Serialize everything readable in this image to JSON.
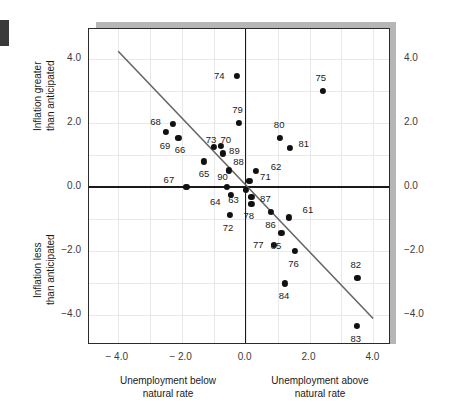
{
  "chart_data": {
    "type": "scatter",
    "title": "",
    "xlabel": "Unemployment relative to natural rate",
    "ylabel": "Inflation relative to anticipated",
    "xlim": [
      -4.9,
      4.55
    ],
    "ylim": [
      -4.95,
      4.95
    ],
    "grid": true,
    "legend": "none",
    "xticks": [
      -4.0,
      -2.0,
      0.0,
      2.0,
      4.0
    ],
    "xticklabels": [
      "− 4.0",
      "− 2.0",
      "0.0",
      "2.0",
      "4.0"
    ],
    "yticks": [
      4.0,
      2.0,
      0.0,
      -2.0,
      -4.0
    ],
    "yticklabels": [
      "4.0",
      "2.0",
      "0.0",
      "−2.0",
      "−4.0"
    ],
    "yticklabels_right": [
      "4.0",
      "2.0",
      "0.0",
      "−2.0",
      "−4.0"
    ],
    "point_labels_are": "two-digit year",
    "points": [
      {
        "label": "61",
        "x": 1.35,
        "y": -0.95,
        "lx": 1.95,
        "ly": -0.72
      },
      {
        "label": "62",
        "x": 0.32,
        "y": 0.5,
        "lx": 0.95,
        "ly": 0.63
      },
      {
        "label": "63",
        "x": 0.0,
        "y": -0.1,
        "lx": -0.38,
        "ly": -0.4
      },
      {
        "label": "64",
        "x": -0.45,
        "y": -0.25,
        "lx": -0.95,
        "ly": -0.48
      },
      {
        "label": "65",
        "x": -1.3,
        "y": 0.8,
        "lx": -1.3,
        "ly": 0.4
      },
      {
        "label": "66",
        "x": -2.1,
        "y": 1.55,
        "lx": -2.05,
        "ly": 1.15
      },
      {
        "label": "67",
        "x": -1.85,
        "y": 0.0,
        "lx": -2.4,
        "ly": 0.22
      },
      {
        "label": "68",
        "x": -2.28,
        "y": 1.98,
        "lx": -2.82,
        "ly": 2.05
      },
      {
        "label": "69",
        "x": -2.5,
        "y": 1.72,
        "lx": -2.52,
        "ly": 1.3
      },
      {
        "label": "70",
        "x": -0.78,
        "y": 1.3,
        "lx": -0.62,
        "ly": 1.48
      },
      {
        "label": "71",
        "x": 0.12,
        "y": 0.18,
        "lx": 0.62,
        "ly": 0.3
      },
      {
        "label": "72",
        "x": -0.5,
        "y": -0.88,
        "lx": -0.55,
        "ly": -1.28
      },
      {
        "label": "73",
        "x": -1.0,
        "y": 1.25,
        "lx": -1.08,
        "ly": 1.48
      },
      {
        "label": "74",
        "x": -0.28,
        "y": 3.48,
        "lx": -0.82,
        "ly": 3.48
      },
      {
        "label": "75",
        "x": 2.42,
        "y": 3.0,
        "lx": 2.35,
        "ly": 3.4
      },
      {
        "label": "76",
        "x": 1.55,
        "y": -2.0,
        "lx": 1.5,
        "ly": -2.4
      },
      {
        "label": "77",
        "x": 0.88,
        "y": -1.82,
        "lx": 0.4,
        "ly": -1.82
      },
      {
        "label": "78",
        "x": 0.18,
        "y": -0.52,
        "lx": 0.1,
        "ly": -0.92
      },
      {
        "label": "79",
        "x": -0.2,
        "y": 2.0,
        "lx": -0.25,
        "ly": 2.4
      },
      {
        "label": "80",
        "x": 1.08,
        "y": 1.55,
        "lx": 1.05,
        "ly": 1.95
      },
      {
        "label": "81",
        "x": 1.38,
        "y": 1.22,
        "lx": 1.82,
        "ly": 1.35
      },
      {
        "label": "82",
        "x": 3.5,
        "y": -2.85,
        "lx": 3.45,
        "ly": -2.45
      },
      {
        "label": "83",
        "x": 3.48,
        "y": -4.35,
        "lx": 3.45,
        "ly": -4.75
      },
      {
        "label": "84",
        "x": 1.22,
        "y": -3.02,
        "lx": 1.2,
        "ly": -3.42
      },
      {
        "label": "85",
        "x": 1.12,
        "y": -1.45,
        "lx": 0.95,
        "ly": -1.85
      },
      {
        "label": "86",
        "x": 0.8,
        "y": -0.78,
        "lx": 0.78,
        "ly": -1.18
      },
      {
        "label": "87",
        "x": 0.18,
        "y": -0.32,
        "lx": 0.62,
        "ly": -0.38
      },
      {
        "label": "88",
        "x": -0.52,
        "y": 0.52,
        "lx": -0.22,
        "ly": 0.78
      },
      {
        "label": "89",
        "x": -0.72,
        "y": 1.05,
        "lx": -0.35,
        "ly": 1.12
      },
      {
        "label": "90",
        "x": -0.58,
        "y": 0.0,
        "lx": -0.72,
        "ly": 0.3
      }
    ],
    "trendline": {
      "x1": -3.98,
      "y1": 4.25,
      "x2": 4.05,
      "y2": -4.18,
      "color": "#666666"
    }
  },
  "captions": {
    "top_left_side": "Inflation greater\nthan anticipated",
    "bottom_left_side": "Inflation less\nthan anticipated",
    "bottom_left": "Unemployment below\nnatural rate",
    "bottom_right": "Unemployment above\nnatural rate"
  }
}
